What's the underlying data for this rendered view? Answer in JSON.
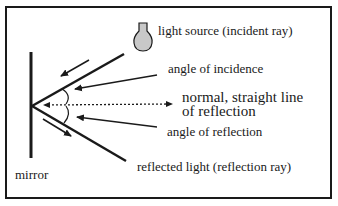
{
  "diagram": {
    "labels": {
      "light_source": "light source (incident ray)",
      "angle_incidence": "angle of incidence",
      "normal_line1": "normal, straight line",
      "normal_line2": "of reflection",
      "angle_reflection": "angle of reflection",
      "reflected_light": "reflected light (reflection ray)",
      "mirror": "mirror"
    },
    "icons": {
      "light_bulb": "light-bulb-icon"
    },
    "colors": {
      "stroke": "#1a1a1a",
      "bulb_fill": "#c8c8c8",
      "background": "#ffffff"
    }
  }
}
